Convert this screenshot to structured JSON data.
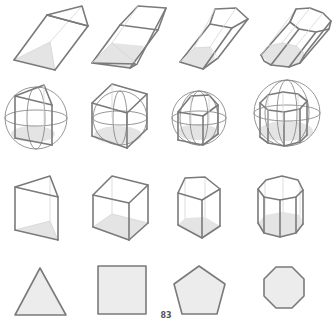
{
  "page": {
    "number": "83"
  },
  "figure": {
    "rows": [
      {
        "name": "oblique-prisms",
        "items": [
          "oblique triangular prism",
          "oblique square prism (parallelepiped)",
          "oblique pentagonal prism",
          "oblique octagonal prism"
        ]
      },
      {
        "name": "prisms-inscribed-in-spheres",
        "items": [
          "triangular prism in sphere",
          "cube in sphere",
          "pentagonal prism in sphere",
          "octagonal prism in sphere"
        ]
      },
      {
        "name": "right-prisms",
        "items": [
          "triangular prism",
          "cube",
          "pentagonal prism",
          "octagonal prism"
        ]
      },
      {
        "name": "base-polygons",
        "items": [
          "triangle",
          "square",
          "pentagon",
          "octagon"
        ]
      }
    ],
    "colors": {
      "edge": "#7a7a7a",
      "shade": "#e4e4e4",
      "hidden_edge": "#d4d4d4",
      "background": "#ffffff"
    }
  }
}
